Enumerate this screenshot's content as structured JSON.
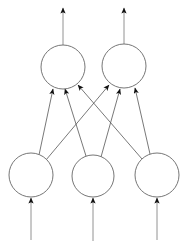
{
  "diagram": {
    "type": "neural-network-graph",
    "background_color": "#ffffff",
    "node_stroke_color": "#666666",
    "node_fill_color": "#ffffff",
    "edge_color": "#555555",
    "arrow_color": "#111111",
    "layers": [
      {
        "name": "output-layer",
        "position": "top",
        "node_count": 2,
        "nodes": [
          {
            "id": "out-1",
            "cx": 63,
            "cy": 67,
            "r": 22,
            "label": ""
          },
          {
            "id": "out-2",
            "cx": 124,
            "cy": 66,
            "r": 22,
            "label": ""
          }
        ]
      },
      {
        "name": "input-layer",
        "position": "bottom",
        "node_count": 3,
        "nodes": [
          {
            "id": "in-1",
            "cx": 31,
            "cy": 175,
            "r": 22,
            "label": ""
          },
          {
            "id": "in-2",
            "cx": 93,
            "cy": 176,
            "r": 21,
            "label": ""
          },
          {
            "id": "in-3",
            "cx": 157,
            "cy": 175,
            "r": 22,
            "label": ""
          }
        ]
      }
    ],
    "edges": [
      {
        "id": "edge-in1-out1",
        "from": "in-1",
        "to": "out-1",
        "x1": 39,
        "y1": 155,
        "x2": 53,
        "y2": 89
      },
      {
        "id": "edge-in1-out2",
        "from": "in-1",
        "to": "out-2",
        "x1": 46,
        "y1": 160,
        "x2": 109,
        "y2": 85
      },
      {
        "id": "edge-in2-out1",
        "from": "in-2",
        "to": "out-1",
        "x1": 86,
        "y1": 156,
        "x2": 65,
        "y2": 89
      },
      {
        "id": "edge-in2-out2",
        "from": "in-2",
        "to": "out-2",
        "x1": 101,
        "y1": 157,
        "x2": 120,
        "y2": 89
      },
      {
        "id": "edge-in3-out1",
        "from": "in-3",
        "to": "out-1",
        "x1": 142,
        "y1": 159,
        "x2": 78,
        "y2": 85
      },
      {
        "id": "edge-in3-out2",
        "from": "in-3",
        "to": "out-2",
        "x1": 150,
        "y1": 154,
        "x2": 135,
        "y2": 88
      }
    ],
    "output_arrows": [
      {
        "id": "output-arrow-1",
        "node": "out-1",
        "x": 63,
        "y_start": 45,
        "y_end": 8
      },
      {
        "id": "output-arrow-2",
        "node": "out-2",
        "x": 124,
        "y_start": 44,
        "y_end": 8
      }
    ],
    "input_arrows": [
      {
        "id": "input-arrow-1",
        "node": "in-1",
        "x": 31,
        "y_start": 240,
        "y_end": 198
      },
      {
        "id": "input-arrow-2",
        "node": "in-2",
        "x": 93,
        "y_start": 241,
        "y_end": 198
      },
      {
        "id": "input-arrow-3",
        "node": "in-3",
        "x": 157,
        "y_start": 240,
        "y_end": 198
      }
    ]
  }
}
